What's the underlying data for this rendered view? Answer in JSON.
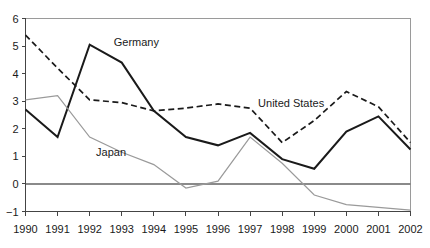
{
  "chart_data": {
    "type": "line",
    "title": "",
    "subtitle": "",
    "xlabel": "",
    "ylabel": "",
    "grid": false,
    "legend_position": "inline-annotation",
    "categories": [
      "1990",
      "1991",
      "1992",
      "1993",
      "1994",
      "1995",
      "1996",
      "1997",
      "1998",
      "1999",
      "2000",
      "2001",
      "2002"
    ],
    "x": [
      1990,
      1991,
      1992,
      1993,
      1994,
      1995,
      1996,
      1997,
      1998,
      1999,
      2000,
      2001,
      2002
    ],
    "xlim": [
      1990,
      2002
    ],
    "ylim": [
      -1,
      6
    ],
    "y_ticks": [
      "6",
      "5",
      "4",
      "3",
      "2",
      "1",
      "0",
      "−1"
    ],
    "y_tick_values": [
      6,
      5,
      4,
      3,
      2,
      1,
      0,
      -1
    ],
    "x_tick_labels": [
      "1990",
      "1991",
      "1992",
      "1993",
      "1994",
      "1995",
      "1996",
      "1997",
      "1998",
      "1999",
      "2000",
      "2001",
      "2002"
    ],
    "series": [
      {
        "name": "Germany",
        "style": "solid",
        "color": "#1a1a1a",
        "width": 2.0,
        "label_x": 1992.75,
        "label_y": 5.0,
        "values": [
          2.7,
          1.7,
          5.05,
          4.4,
          2.65,
          1.7,
          1.4,
          1.85,
          0.9,
          0.55,
          1.9,
          2.45,
          1.25
        ]
      },
      {
        "name": "United States",
        "style": "dashed",
        "color": "#1a1a1a",
        "width": 1.7,
        "label_x": 1997.25,
        "label_y": 2.78,
        "values": [
          5.4,
          4.2,
          3.05,
          2.95,
          2.65,
          2.75,
          2.9,
          2.75,
          1.5,
          2.3,
          3.35,
          2.8,
          1.5
        ]
      },
      {
        "name": "Japan",
        "style": "solid",
        "color": "#9a9a9a",
        "width": 1.2,
        "label_x": 1992.2,
        "label_y": 1.0,
        "values": [
          3.05,
          3.2,
          1.7,
          1.15,
          0.7,
          -0.15,
          0.1,
          1.7,
          0.75,
          -0.4,
          -0.75,
          -0.85,
          -0.95
        ]
      }
    ],
    "annotations": [
      {
        "text": "Germany",
        "x": 1992.75,
        "y": 5.0
      },
      {
        "text": "United States",
        "x": 1997.25,
        "y": 2.78
      },
      {
        "text": "Japan",
        "x": 1992.2,
        "y": 1.0
      }
    ],
    "colors": {
      "axis": "#444444",
      "zero_line": "#8a8a8a",
      "frame": "#9a9a9a",
      "germany": "#1a1a1a",
      "united_states": "#1a1a1a",
      "japan": "#9a9a9a",
      "background": "#ffffff",
      "text": "#1a1a1a"
    }
  }
}
